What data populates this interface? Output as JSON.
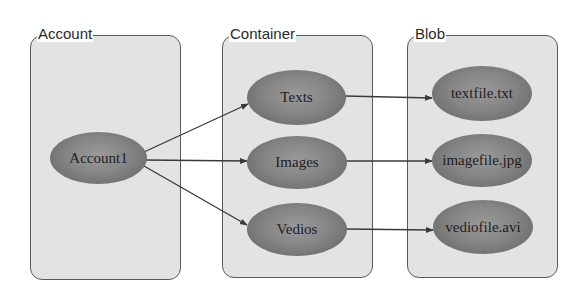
{
  "diagram": {
    "groups": [
      {
        "label": "Account"
      },
      {
        "label": "Container"
      },
      {
        "label": "Blob"
      }
    ],
    "nodes": {
      "account": [
        "Account1"
      ],
      "container": [
        "Texts",
        "Images",
        "Vedios"
      ],
      "blob": [
        "textfile.txt",
        "imagefile.jpg",
        "vediofile.avi"
      ]
    },
    "edges": [
      {
        "from": "Account1",
        "to": "Texts"
      },
      {
        "from": "Account1",
        "to": "Images"
      },
      {
        "from": "Account1",
        "to": "Vedios"
      },
      {
        "from": "Texts",
        "to": "textfile.txt"
      },
      {
        "from": "Images",
        "to": "imagefile.jpg"
      },
      {
        "from": "Vedios",
        "to": "vediofile.avi"
      }
    ],
    "colors": {
      "box_fill": "#e3e3e3",
      "box_border": "#5a5a5a",
      "node_fill": "#858585",
      "edge": "#3a3a3a"
    }
  }
}
